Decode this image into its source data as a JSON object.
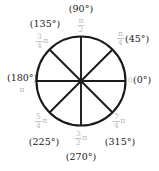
{
  "figure": {
    "type": "unit-circle-angle-diagram",
    "circle": {
      "center_x": 81,
      "center_y": 81,
      "radius": 44.5,
      "stroke_color": "#1a1a1a",
      "stroke_width": 2.1,
      "fill": "none"
    },
    "diameters": [
      {
        "name": "horizontal-diameter",
        "angle_deg": 0
      },
      {
        "name": "vertical-diameter",
        "angle_deg": 90
      },
      {
        "name": "diagonal-diameter-45",
        "angle_deg": 45
      },
      {
        "name": "diagonal-diameter-135",
        "angle_deg": 135
      }
    ],
    "colors": {
      "degree_text": "#1a1a1a",
      "radian_text": "#b9b9b9",
      "line": "#1a1a1a",
      "background": "#ffffff"
    }
  },
  "angles": [
    {
      "id": "angle-0",
      "degrees": "(0°)",
      "radian_numerator": "",
      "radian_denominator": "",
      "radian_plain": "0",
      "radian_pi": ""
    },
    {
      "id": "angle-45",
      "degrees": "(45°)",
      "radian_numerator": "π",
      "radian_denominator": "4",
      "radian_plain": "",
      "radian_pi": ""
    },
    {
      "id": "angle-90",
      "degrees": "(90°)",
      "radian_numerator": "π",
      "radian_denominator": "2",
      "radian_plain": "",
      "radian_pi": ""
    },
    {
      "id": "angle-135",
      "degrees": "(135°)",
      "radian_numerator": "3",
      "radian_denominator": "4",
      "radian_plain": "",
      "radian_pi": "π"
    },
    {
      "id": "angle-180",
      "degrees": "(180°)",
      "radian_numerator": "",
      "radian_denominator": "",
      "radian_plain": "π",
      "radian_pi": ""
    },
    {
      "id": "angle-225",
      "degrees": "(225°)",
      "radian_numerator": "5",
      "radian_denominator": "4",
      "radian_plain": "",
      "radian_pi": "π"
    },
    {
      "id": "angle-270",
      "degrees": "(270°)",
      "radian_numerator": "3",
      "radian_denominator": "2",
      "radian_plain": "",
      "radian_pi": "π"
    },
    {
      "id": "angle-315",
      "degrees": "(315°)",
      "radian_numerator": "7",
      "radian_denominator": "4",
      "radian_plain": "",
      "radian_pi": "π"
    }
  ]
}
